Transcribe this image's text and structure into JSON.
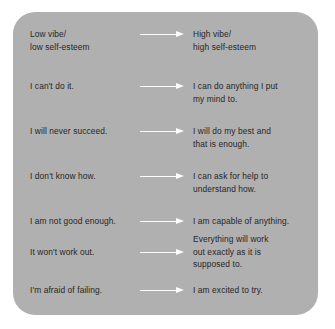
{
  "card": {
    "background_color": "#b0b0b0",
    "text_color": "#262626",
    "arrow_color": "#fdfdfd",
    "headers": {
      "left": "Low vibe/ low self-esteem",
      "right": "High vibe/ high self-esteem"
    }
  },
  "rows": [
    {
      "arrow_icon": "right-arrow-icon",
      "left_lines": [
        "Low vibe/",
        "low self-esteem"
      ],
      "right_lines": [
        "High vibe/",
        "high self-esteem"
      ]
    },
    {
      "arrow_icon": "right-arrow-icon",
      "left_lines": [
        "I can't do it."
      ],
      "right_lines": [
        "I can do anything I put",
        "my mind to."
      ]
    },
    {
      "arrow_icon": "right-arrow-icon",
      "left_lines": [
        "I will never succeed."
      ],
      "right_lines": [
        "I will do my best and",
        "that is enough."
      ]
    },
    {
      "arrow_icon": "right-arrow-icon",
      "left_lines": [
        "I don't know how."
      ],
      "right_lines": [
        "I can ask for help to",
        "understand how."
      ]
    },
    {
      "arrow_icon": "right-arrow-icon",
      "left_lines": [
        "I am not good enough."
      ],
      "right_lines": [
        "I am capable of anything."
      ]
    },
    {
      "arrow_icon": "right-arrow-icon",
      "left_lines": [
        "It won't work out."
      ],
      "right_lines": [
        "Everything will work",
        "out exactly as it is",
        "supposed to."
      ]
    },
    {
      "arrow_icon": "right-arrow-icon",
      "left_lines": [
        "I'm afraid of failing."
      ],
      "right_lines": [
        "I am excited to try."
      ]
    }
  ]
}
